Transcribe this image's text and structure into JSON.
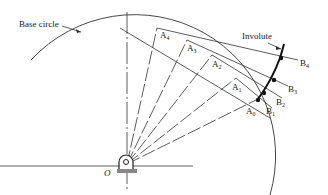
{
  "diagram": {
    "labels": {
      "base_circle": "Base circle",
      "involute": "Involute",
      "origin": "O"
    },
    "points_A": [
      {
        "name": "A",
        "sub": "0"
      },
      {
        "name": "A",
        "sub": "1"
      },
      {
        "name": "A",
        "sub": "2"
      },
      {
        "name": "A",
        "sub": "3"
      },
      {
        "name": "A",
        "sub": "4"
      }
    ],
    "points_B": [
      {
        "name": "B",
        "sub": "1"
      },
      {
        "name": "B",
        "sub": "2"
      },
      {
        "name": "B",
        "sub": "3"
      },
      {
        "name": "B",
        "sub": "4"
      }
    ]
  }
}
